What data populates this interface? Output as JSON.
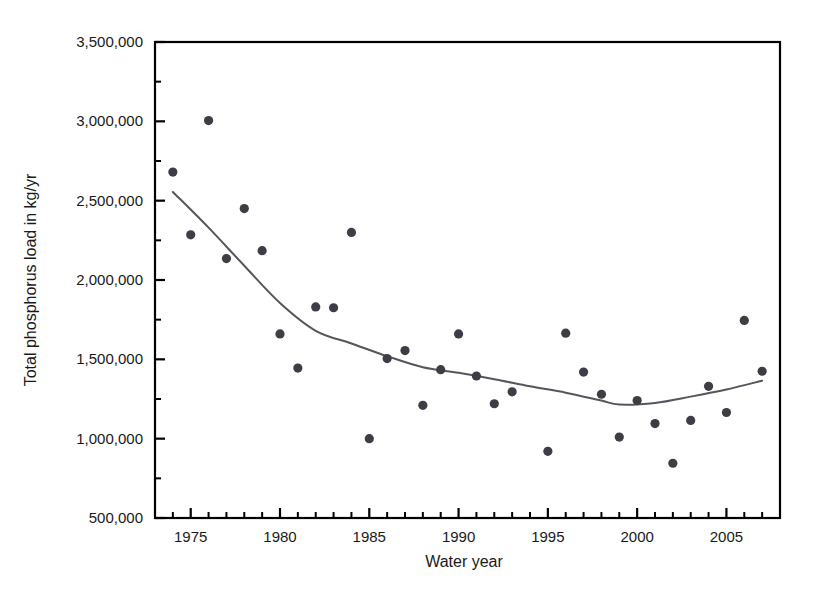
{
  "chart_data": {
    "type": "scatter",
    "title": "",
    "xlabel": "Water year",
    "ylabel": "Total phosphorus load in kg/yr",
    "xlim": [
      1973,
      2008
    ],
    "ylim": [
      500000,
      3500000
    ],
    "grid": false,
    "legend": "none",
    "x_ticks": [
      1975,
      1980,
      1985,
      1990,
      1995,
      2000,
      2005
    ],
    "x_tick_labels": [
      "1975",
      "1980",
      "1985",
      "1990",
      "1995",
      "2000",
      "2005"
    ],
    "x_minor_tick_interval": 1,
    "y_ticks": [
      500000,
      1000000,
      1500000,
      2000000,
      2500000,
      3000000,
      3500000
    ],
    "y_tick_labels": [
      "500,000",
      "1,000,000",
      "1,500,000",
      "2,000,000",
      "2,500,000",
      "3,000,000",
      "3,500,000"
    ],
    "y_minor_ticks": [
      750000,
      1250000,
      1750000,
      2250000,
      2750000,
      3250000
    ],
    "marker_color": "#3d3d46",
    "line_color": "#55555e",
    "axis_color": "#000000",
    "series": [
      {
        "name": "Annual total phosphorus load",
        "type": "scatter",
        "x": [
          1974,
          1975,
          1976,
          1977,
          1978,
          1979,
          1980,
          1981,
          1982,
          1983,
          1984,
          1985,
          1986,
          1987,
          1988,
          1989,
          1990,
          1991,
          1992,
          1993,
          1995,
          1996,
          1997,
          1998,
          1999,
          2000,
          2001,
          2002,
          2003,
          2004,
          2005,
          2006,
          2007
        ],
        "y": [
          2680000,
          2285000,
          3005000,
          2135000,
          2450000,
          2185000,
          1660000,
          1445000,
          1830000,
          1825000,
          2300000,
          1000000,
          1505000,
          1555000,
          1210000,
          1435000,
          1660000,
          1395000,
          1220000,
          1295000,
          920000,
          1665000,
          1420000,
          1280000,
          1010000,
          1240000,
          1095000,
          845000,
          1115000,
          1330000,
          1165000,
          1745000,
          1425000
        ]
      },
      {
        "name": "Smoothed trend (LOWESS)",
        "type": "line",
        "x": [
          1974,
          1976,
          1978,
          1980,
          1982,
          1984,
          1986,
          1988,
          1990,
          1992,
          1994,
          1996,
          1998,
          1999,
          2001,
          2003,
          2005,
          2007
        ],
        "y": [
          2555000,
          2330000,
          2090000,
          1855000,
          1680000,
          1600000,
          1520000,
          1450000,
          1415000,
          1375000,
          1330000,
          1290000,
          1240000,
          1215000,
          1225000,
          1265000,
          1310000,
          1365000
        ]
      }
    ]
  },
  "axis": {
    "x_title": "Water year",
    "y_title": "Total phosphorus load in kg/yr"
  }
}
